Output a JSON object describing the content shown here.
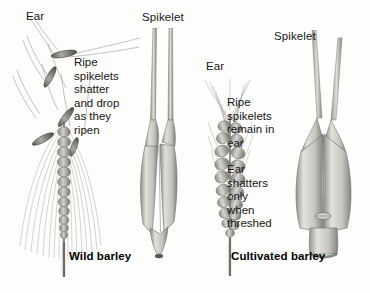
{
  "figure": {
    "background_color": "#fdfdfc",
    "ink_color": "#4a4a4a",
    "fill_light": "#d8d8d4",
    "fill_mid": "#b3b3ae",
    "fill_dark": "#7a7a76"
  },
  "left_panel": {
    "caption": "Wild barley",
    "ear_label": "Ear",
    "spikelet_label": "Spikelet",
    "annotation_lines": [
      "Ripe",
      "spikelets",
      "shatter",
      "and drop",
      "as they",
      "ripen"
    ]
  },
  "right_panel": {
    "caption": "Cultivated barley",
    "ear_label": "Ear",
    "spikelet_label": "Spikelet",
    "annotation_lines_1": [
      "Ripe",
      "spikelets",
      "remain in",
      "ear"
    ],
    "annotation_lines_2": [
      "Ear",
      "shatters",
      "only",
      "when",
      "threshed"
    ]
  }
}
